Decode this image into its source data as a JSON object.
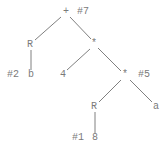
{
  "diagram": {
    "type": "expression-tree",
    "text_color": "#7a7a7a",
    "edge_color": "#808080",
    "nodes": [
      {
        "id": "plus",
        "label": "+",
        "x": 66,
        "y": 12,
        "tag": "#7",
        "tag_x": 77
      },
      {
        "id": "r1",
        "label": "R",
        "x": 30,
        "y": 45
      },
      {
        "id": "b",
        "label": "b",
        "x": 31,
        "y": 75,
        "tag": "#2",
        "tag_x": 7
      },
      {
        "id": "mul1",
        "label": "*",
        "x": 94,
        "y": 44
      },
      {
        "id": "four",
        "label": "4",
        "x": 63,
        "y": 75
      },
      {
        "id": "mul2",
        "label": "*",
        "x": 125,
        "y": 75,
        "tag": "#5",
        "tag_x": 138
      },
      {
        "id": "r2",
        "label": "R",
        "x": 94,
        "y": 107
      },
      {
        "id": "a",
        "label": "a",
        "x": 156,
        "y": 107
      },
      {
        "id": "eight",
        "label": "8",
        "x": 95,
        "y": 138,
        "tag": "#1",
        "tag_x": 72
      }
    ],
    "edges": [
      {
        "from": "plus",
        "to": "r1",
        "x1": 61,
        "y1": 17,
        "x2": 35,
        "y2": 40
      },
      {
        "from": "plus",
        "to": "mul1",
        "x1": 70,
        "y1": 17,
        "x2": 91,
        "y2": 39
      },
      {
        "from": "r1",
        "to": "b",
        "x1": 31,
        "y1": 50,
        "x2": 31,
        "y2": 70
      },
      {
        "from": "mul1",
        "to": "four",
        "x1": 90,
        "y1": 49,
        "x2": 67,
        "y2": 70
      },
      {
        "from": "mul1",
        "to": "mul2",
        "x1": 98,
        "y1": 48,
        "x2": 121,
        "y2": 71
      },
      {
        "from": "mul2",
        "to": "r2",
        "x1": 121,
        "y1": 80,
        "x2": 99,
        "y2": 102
      },
      {
        "from": "mul2",
        "to": "a",
        "x1": 130,
        "y1": 80,
        "x2": 152,
        "y2": 102
      },
      {
        "from": "r2",
        "to": "eight",
        "x1": 95,
        "y1": 112,
        "x2": 95,
        "y2": 133
      }
    ]
  }
}
